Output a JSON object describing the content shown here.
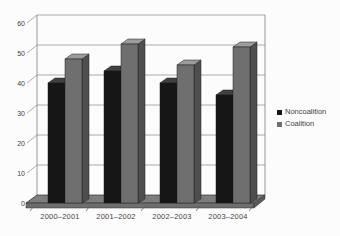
{
  "chart_data": {
    "type": "bar",
    "style": "3d-clustered-column",
    "title": "",
    "xlabel": "",
    "ylabel": "",
    "categories": [
      "2000–2001",
      "2001–2002",
      "2002–2003",
      "2003–2004"
    ],
    "series": [
      {
        "name": "Noncoalition",
        "values": [
          40,
          44,
          40,
          36
        ],
        "color": "#161616",
        "top_color": "#404040",
        "side_color": "#2a2a2a"
      },
      {
        "name": "Coalition",
        "values": [
          48,
          53,
          46,
          52
        ],
        "color": "#6f6f6f",
        "top_color": "#9c9c9c",
        "side_color": "#4f4f4f"
      }
    ],
    "ylim": [
      0,
      60
    ],
    "ytick_step": 10,
    "yticks": [
      0,
      10,
      20,
      30,
      40,
      50,
      60
    ],
    "grid": true,
    "legend_position": "right",
    "colors": {
      "gridline": "#909090",
      "wall_edge": "#808080",
      "floor": "#7d7d7d",
      "floor_front": "#6e6e6e",
      "floor_side": "#5a5a5a",
      "edge": "#1c1c1c",
      "text": "#3f3f3f",
      "background": "#fcfcfc"
    }
  }
}
